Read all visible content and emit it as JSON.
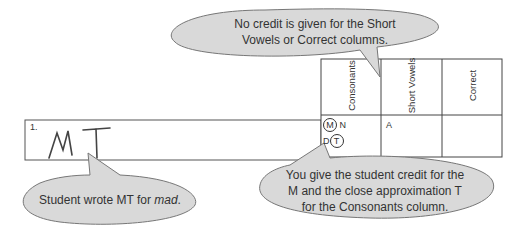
{
  "callouts": {
    "top": {
      "line1": "No credit is given for the Short",
      "line2": "Vowels or Correct columns."
    },
    "left": {
      "prefix": "Student wrote MT for ",
      "emph": "mad",
      "suffix": "."
    },
    "right": {
      "line1": "You give the student credit for the",
      "line2": "M and the close approximation T",
      "line3": "for the Consonants column."
    }
  },
  "row": {
    "number": "1.",
    "student_writing": "MT"
  },
  "table": {
    "headers": [
      "Consonants",
      "Short Vowels",
      "Correct"
    ],
    "consonants_cell": {
      "row1": [
        "M",
        "N"
      ],
      "row2": [
        "D",
        "T"
      ],
      "circled": [
        "M",
        "T"
      ]
    },
    "short_vowels_cell": "A",
    "correct_cell": ""
  }
}
